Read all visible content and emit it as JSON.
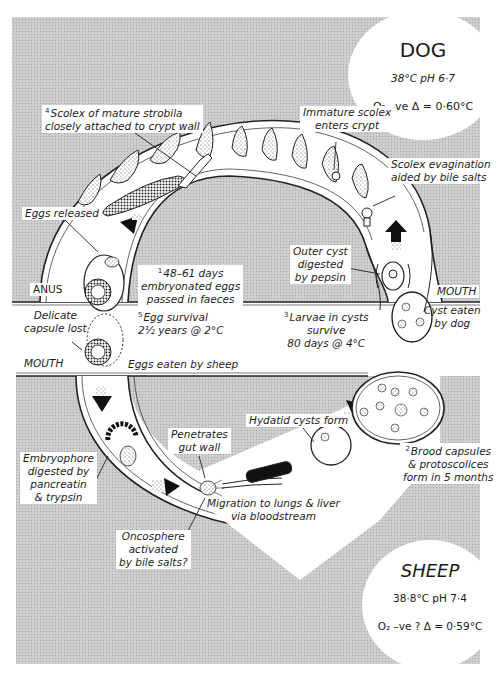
{
  "colors": {
    "background_gray": "#c9c9c9",
    "paper_white": "#ffffff",
    "ink": "#1a1a1a"
  },
  "dog": {
    "title": "DOG",
    "temp_ph": "38°C  pH 6·7",
    "oxygen_freezing": "O₂ –ve  Δ = 0·60°C"
  },
  "sheep": {
    "title": "SHEEP",
    "temp_ph": "38·8°C pH 7·4",
    "oxygen_freezing": "O₂ –ve ?  Δ = 0·59°C"
  },
  "labels": {
    "scolex_mature": {
      "num": "4",
      "line1": "Scolex of mature strobila",
      "line2": "closely attached to crypt wall"
    },
    "immature_scolex": {
      "line1": "Immature scolex",
      "line2": "enters crypt"
    },
    "scolex_evagination": {
      "line1": "Scolex evagination",
      "line2": "aided by bile salts"
    },
    "eggs_released": "Eggs released",
    "outer_cyst": {
      "line1": "Outer cyst",
      "line2": "digested",
      "line3": "by pepsin"
    },
    "anus": "ANUS",
    "dog_mouth": "MOUTH",
    "eggs_passed": {
      "num": "1",
      "line1": "48–61 days",
      "line2": "embryonated eggs",
      "line3": "passed in faeces"
    },
    "delicate_capsule": {
      "line1": "Delicate",
      "line2": "capsule lost"
    },
    "egg_survival": {
      "num": "5",
      "line1": "Egg survival",
      "line2": "2½ years @ 2°C"
    },
    "larvae_survive": {
      "num": "3",
      "line1": "Larvae in cysts",
      "line2": "survive",
      "line3": "80 days @ 4°C"
    },
    "cyst_eaten": {
      "line1": "Cyst eaten",
      "line2": "by dog"
    },
    "sheep_mouth": "MOUTH",
    "eggs_eaten": "Eggs eaten by sheep",
    "embryophore": {
      "line1": "Embryophore",
      "line2": "digested by",
      "line3": "pancreatin",
      "line4": "& trypsin"
    },
    "penetrates": {
      "line1": "Penetrates",
      "line2": "gut wall"
    },
    "hydatid_form": "Hydatid cysts form",
    "brood_capsules": {
      "num": "2",
      "line1": "Brood capsules",
      "line2": "& protoscolices",
      "line3": "form in 5 months"
    },
    "migration": {
      "line1": "Migration to lungs & liver",
      "line2": "via bloodstream"
    },
    "oncosphere": {
      "line1": "Oncosphere",
      "line2": "activated",
      "line3": "by bile salts?"
    }
  }
}
